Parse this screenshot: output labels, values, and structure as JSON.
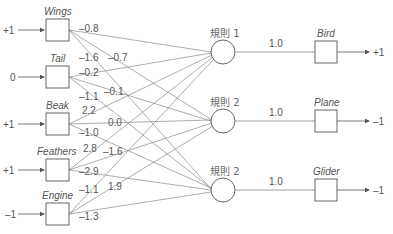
{
  "inputs": [
    {
      "name": "Wings",
      "value": "+1"
    },
    {
      "name": "Tail",
      "value": "0"
    },
    {
      "name": "Beak",
      "value": "+1"
    },
    {
      "name": "Feathers",
      "value": "+1"
    },
    {
      "name": "Engine",
      "value": "–1"
    }
  ],
  "rules": [
    {
      "label": "規則 1"
    },
    {
      "label": "規則 2"
    },
    {
      "label": "規則 2"
    }
  ],
  "weights": {
    "wings": [
      "–0.8",
      "–1.6",
      "–0.7"
    ],
    "tail": [
      "–0.2",
      "–0.1",
      "–1.1"
    ],
    "beak": [
      "2.2",
      "0.0",
      "–1.0"
    ],
    "feathers": [
      "2.8",
      "–1.6",
      "–2.9"
    ],
    "engine": [
      "–1.1",
      "1.9",
      "–1.3"
    ]
  },
  "outputs": [
    {
      "name": "Bird",
      "weight": "1.0",
      "value": "+1"
    },
    {
      "name": "Plane",
      "weight": "1.0",
      "value": "–1"
    },
    {
      "name": "Glider",
      "weight": "1.0",
      "value": "–1"
    }
  ],
  "colors": {
    "line": "#888888",
    "box": "#555555",
    "text": "#555555"
  }
}
